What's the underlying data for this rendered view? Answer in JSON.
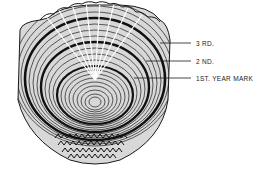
{
  "figure": {
    "colors": {
      "ink": "#1a1a1a",
      "background": "#ffffff",
      "label_text": "#222222"
    }
  },
  "labels": [
    {
      "id": "third",
      "text": "3 RD.",
      "line_y": 43,
      "line_x1": 160,
      "line_x2": 191,
      "text_x": 196
    },
    {
      "id": "second",
      "text": "2 ND.",
      "line_y": 61,
      "line_x1": 146,
      "line_x2": 191,
      "text_x": 196
    },
    {
      "id": "first",
      "text": "1ST. YEAR MARK",
      "line_y": 78,
      "line_x1": 134,
      "line_x2": 191,
      "text_x": 196
    }
  ]
}
